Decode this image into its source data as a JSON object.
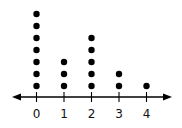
{
  "chart_data": {
    "type": "dot",
    "title": "",
    "xlabel": "",
    "ylabel": "",
    "categories": [
      "0",
      "1",
      "2",
      "3",
      "4"
    ],
    "values": [
      7,
      3,
      5,
      2,
      1
    ],
    "xlim": [
      0,
      4
    ],
    "grid": false,
    "legend": null
  },
  "axis": {
    "tick_labels": [
      "0",
      "1",
      "2",
      "3",
      "4"
    ]
  }
}
